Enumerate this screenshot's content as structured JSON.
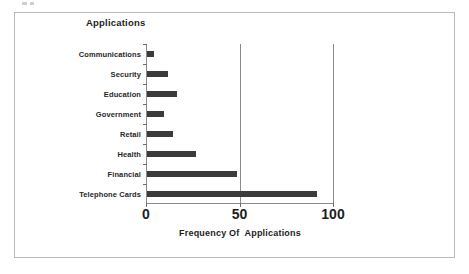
{
  "chart_data": {
    "type": "bar",
    "orientation": "horizontal",
    "title": "Applications",
    "xlabel": "Frequency Of  Applications",
    "ylabel": "",
    "categories": [
      "Communications",
      "Security",
      "Education",
      "Government",
      "Retail",
      "Health",
      "Financial",
      "Telephone  Cards"
    ],
    "values": [
      4,
      11,
      16,
      9,
      14,
      26,
      48,
      91
    ],
    "xlim": [
      0,
      100
    ],
    "xticks": [
      0,
      50,
      100
    ],
    "xtick_labels": [
      "0",
      "50",
      "100"
    ],
    "grid": "vertical gridlines at 50 and 100",
    "legend": null,
    "bar_color": "#3b3b3b",
    "axis_color": "#8a8a8a",
    "frame_color": "#b9b9b9",
    "background": "#ffffff"
  }
}
